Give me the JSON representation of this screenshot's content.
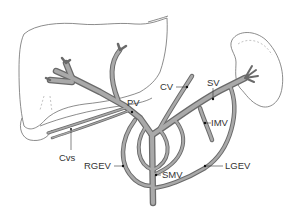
{
  "diagram": {
    "type": "anatomical-illustration",
    "colors": {
      "vessel_fill": "#a9a9a9",
      "vessel_outline": "#6a6a6a",
      "organ_outline": "#6e6e6e",
      "label_text": "#333333",
      "background": "#ffffff"
    },
    "organs": [
      {
        "id": "liver",
        "name": "liver-outline"
      },
      {
        "id": "spleen",
        "name": "spleen-outline"
      }
    ],
    "labels": {
      "pv": "PV",
      "cv": "CV",
      "sv": "SV",
      "imv": "IMV",
      "cvs": "Cvs",
      "rgev": "RGEV",
      "lgev": "LGEV",
      "smv": "SMV"
    }
  }
}
